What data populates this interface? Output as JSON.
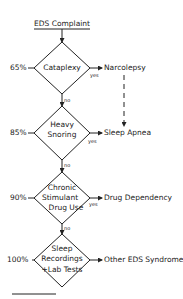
{
  "title": "EDS Complaint",
  "nodes": [
    {
      "pct": "65%",
      "lines": [
        "Cataplexy"
      ],
      "yes": "yes",
      "no": "no",
      "outcome": "Narcolepsy"
    },
    {
      "pct": "85%",
      "lines": [
        "Heavy",
        "Snoring"
      ],
      "yes": "yes",
      "no": "no",
      "outcome": "Sleep Apnea"
    },
    {
      "pct": "90%",
      "lines": [
        "Chronic",
        "Stimulant",
        "Drug Use"
      ],
      "yes": "yes",
      "no": "no",
      "outcome": "Drug Dependency"
    },
    {
      "pct": "100%",
      "lines": [
        "Sleep",
        "Recordings",
        "+Lab Tests"
      ],
      "outcome": "Other EDS Syndromes"
    }
  ]
}
